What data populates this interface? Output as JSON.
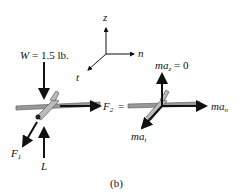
{
  "figure": {
    "caption": "(b)",
    "axes": {
      "z": "z",
      "n": "n",
      "t": "t"
    },
    "free_body": {
      "weight_label_prefix": "W",
      "weight_label_value": " = 1.5 lb.",
      "force1_base": "F",
      "force1_sub": "1",
      "force2_base": "F",
      "force2_sub": "2",
      "equals": "=",
      "lift_label": "L"
    },
    "kinetic": {
      "maz_base": "ma",
      "maz_sub": "z",
      "maz_value": " = 0",
      "man_base": "ma",
      "man_sub": "n",
      "mat_base": "ma",
      "mat_sub": "t"
    }
  }
}
